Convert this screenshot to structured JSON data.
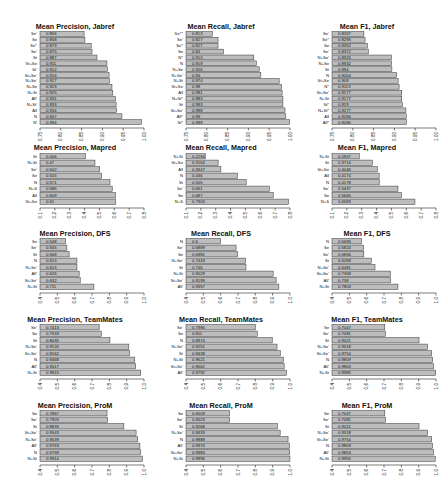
{
  "chart_data": [
    {
      "type": "bar",
      "orientation": "horizontal",
      "title": "Mean Precision, Jabref",
      "xlim": [
        0.75,
        1.0
      ],
      "ticks": [
        "0.75",
        "0.80",
        "0.85",
        "0.90",
        "0.95",
        "1.00"
      ],
      "categories": [
        "Se'",
        "Se",
        "Se*",
        "Se'",
        "St",
        "St+Se",
        "St'",
        "St+Se'",
        "N+Se'",
        "N+Se",
        "N+St",
        "All'",
        "N+St'",
        "All",
        "N",
        "N'"
      ],
      "values": [
        0.856,
        0.858,
        0.873,
        0.875,
        0.887,
        0.911,
        0.912,
        0.916,
        0.917,
        0.923,
        0.925,
        0.931,
        0.933,
        0.934,
        0.947,
        0.994
      ]
    },
    {
      "type": "bar",
      "orientation": "horizontal",
      "title": "Mean Recall, Jabref",
      "xlim": [
        0.75,
        1.0
      ],
      "ticks": [
        "0.75",
        "0.80",
        "0.85",
        "0.90",
        "0.95",
        "1.00"
      ],
      "categories": [
        "Se**",
        "Se'",
        "Se*",
        "Se",
        "N*",
        "N",
        "N+Se",
        "N+Se'",
        "N+St",
        "St+Se",
        "All",
        "N+St*",
        "St",
        "St+Se'",
        "All*",
        "St*"
      ],
      "values": [
        0.813,
        0.827,
        0.827,
        0.84,
        0.913,
        0.919,
        0.926,
        0.93,
        0.974,
        0.98,
        0.981,
        0.983,
        0.983,
        0.988,
        0.99,
        0.999
      ]
    },
    {
      "type": "bar",
      "orientation": "horizontal",
      "title": "Mean F1, Jabref",
      "xlim": [
        0.75,
        1.0
      ],
      "ticks": [
        "0.75",
        "0.80",
        "0.85",
        "0.90",
        "0.95",
        "1.00"
      ],
      "categories": [
        "Se'",
        "Se*",
        "Se",
        "Se'",
        "N+Se'",
        "N+Se",
        "St",
        "N",
        "St+Se",
        "N*",
        "St+Se'",
        "N+St",
        "St*",
        "N+St*",
        "All",
        "All*"
      ],
      "values": [
        0.8267,
        0.8295,
        0.8352,
        0.8372,
        0.8926,
        0.8932,
        0.894,
        0.9054,
        0.909,
        0.9113,
        0.9177,
        0.9177,
        0.919,
        0.9277,
        0.9284,
        0.9286
      ]
    },
    {
      "type": "bar",
      "orientation": "horizontal",
      "title": "Mean Precision, Mapred",
      "xlim": [
        0.1,
        0.8
      ],
      "ticks": [
        "0.1",
        "0.2",
        "0.3",
        "0.4",
        "0.5",
        "0.6",
        "0.7",
        "0.8"
      ],
      "categories": [
        "St",
        "N+St",
        "Se'",
        "Se",
        "N",
        "N+S",
        "All",
        "St+Se"
      ],
      "values": [
        0.406,
        0.47,
        0.502,
        0.515,
        0.571,
        0.586,
        0.609,
        0.61
      ]
    },
    {
      "type": "bar",
      "orientation": "horizontal",
      "title": "Mean Recall, Mapred",
      "xlim": [
        0.1,
        0.8
      ],
      "ticks": [
        "0.1",
        "0.2",
        "0.3",
        "0.4",
        "0.5",
        "0.6",
        "0.7",
        "0.8"
      ],
      "categories": [
        "N+St",
        "St+Se",
        "All",
        "N",
        "St",
        "Se'",
        "Se",
        "N+S"
      ],
      "values": [
        0.2294,
        0.3164,
        0.3347,
        0.446,
        0.505,
        0.661,
        0.687,
        0.7903
      ]
    },
    {
      "type": "bar",
      "orientation": "horizontal",
      "title": "Mean F1, Mapred",
      "xlim": [
        0.1,
        0.8
      ],
      "ticks": [
        "0.1",
        "0.2",
        "0.3",
        "0.4",
        "0.5",
        "0.6",
        "0.7",
        "0.8"
      ],
      "categories": [
        "N+St",
        "St",
        "St+Se",
        "All",
        "N",
        "Se'",
        "Se",
        "N+S"
      ],
      "values": [
        0.2837,
        0.3714,
        0.4046,
        0.4174,
        0.4178,
        0.5437,
        0.5665,
        0.6583
      ]
    },
    {
      "type": "bar",
      "orientation": "horizontal",
      "title": "Mean Precision, DFS",
      "xlim": [
        0.4,
        1.0
      ],
      "ticks": [
        "0.4",
        "0.5",
        "0.6",
        "0.7",
        "0.8",
        "0.9",
        "1.0"
      ],
      "categories": [
        "Se",
        "Se'",
        "St",
        "N",
        "N+Se'",
        "All'",
        "St+Se'",
        "N+St"
      ],
      "values": [
        0.548,
        0.555,
        0.568,
        0.613,
        0.613,
        0.626,
        0.632,
        0.711
      ]
    },
    {
      "type": "bar",
      "orientation": "horizontal",
      "title": "Mean Recall, DFS",
      "xlim": [
        0.4,
        1.0
      ],
      "ticks": [
        "0.4",
        "0.5",
        "0.6",
        "0.7",
        "0.8",
        "0.9",
        "1.0"
      ],
      "categories": [
        "N",
        "Se'",
        "Se",
        "N+Se'",
        "St",
        "N+St",
        "St+Se'",
        "All'"
      ],
      "values": [
        0.6,
        0.6889,
        0.6981,
        0.7443,
        0.746,
        0.9029,
        0.9199,
        0.9357
      ]
    },
    {
      "type": "bar",
      "orientation": "horizontal",
      "title": "Mean F1, DFS",
      "xlim": [
        0.4,
        1.0
      ],
      "ticks": [
        "0.4",
        "0.5",
        "0.6",
        "0.7",
        "0.8",
        "0.9",
        "1.0"
      ],
      "categories": [
        "N",
        "Se",
        "Se'",
        "St",
        "N+Se'",
        "St+Se'",
        "All'",
        "N+St"
      ],
      "values": [
        0.5696,
        0.5824,
        0.5836,
        0.6268,
        0.6481,
        0.7368,
        0.738,
        0.7803
      ]
    },
    {
      "type": "bar",
      "orientation": "horizontal",
      "title": "Mean Precision, TeamMates",
      "xlim": [
        0.4,
        1.0
      ],
      "ticks": [
        "0.4",
        "0.5",
        "0.6",
        "0.7",
        "0.8",
        "0.9",
        "1.0"
      ],
      "categories": [
        "Se'",
        "Se",
        "St",
        "N+Se'",
        "St+Se'",
        "N",
        "All'",
        "N+St"
      ],
      "values": [
        0.7413,
        0.7533,
        0.8035,
        0.9126,
        0.9162,
        0.9468,
        0.9517,
        0.9815
      ]
    },
    {
      "type": "bar",
      "orientation": "horizontal",
      "title": "Mean Recall, TeamMates",
      "xlim": [
        0.4,
        1.0
      ],
      "ticks": [
        "0.4",
        "0.5",
        "0.6",
        "0.7",
        "0.8",
        "0.9",
        "1.0"
      ],
      "categories": [
        "Se'",
        "Se",
        "N",
        "N+Se'",
        "St",
        "N+St",
        "St+Se'",
        "All'"
      ],
      "values": [
        0.7995,
        0.811,
        0.8974,
        0.9251,
        0.9438,
        0.9621,
        0.9662,
        0.9792
      ]
    },
    {
      "type": "bar",
      "orientation": "horizontal",
      "title": "Mean F1, TeamMates",
      "xlim": [
        0.4,
        1.0
      ],
      "ticks": [
        "0.4",
        "0.5",
        "0.6",
        "0.7",
        "0.8",
        "0.9",
        "1.0"
      ],
      "categories": [
        "Se",
        "Se'",
        "St",
        "N+Se'",
        "St+Se'",
        "N",
        "All'",
        "N+St"
      ],
      "values": [
        0.7047,
        0.7081,
        0.9021,
        0.9518,
        0.9754,
        0.9809,
        0.9863,
        0.9985
      ]
    },
    {
      "type": "bar",
      "orientation": "horizontal",
      "title": "Mean Precision, ProM",
      "xlim": [
        0.4,
        1.0
      ],
      "ticks": [
        "0.4",
        "0.5",
        "0.6",
        "0.7",
        "0.8",
        "0.9",
        "1.0"
      ],
      "categories": [
        "Se",
        "Se'",
        "St",
        "St+Se'",
        "N+Se'",
        "All'",
        "N",
        "N+St"
      ],
      "values": [
        0.7867,
        0.7903,
        0.8839,
        0.9543,
        0.9639,
        0.9763,
        0.9799,
        0.9914
      ]
    },
    {
      "type": "bar",
      "orientation": "horizontal",
      "title": "Mean Recall, ProM",
      "xlim": [
        0.4,
        1.0
      ],
      "ticks": [
        "0.4",
        "0.5",
        "0.6",
        "0.7",
        "0.8",
        "0.9",
        "1.0"
      ],
      "categories": [
        "Se",
        "Se'",
        "St",
        "N+Se'",
        "N",
        "All'",
        "St+Se'",
        "N+St"
      ],
      "values": [
        0.6509,
        0.6523,
        0.9268,
        0.9433,
        0.9888,
        0.9974,
        0.9983,
        0.9996
      ]
    },
    {
      "type": "bar",
      "orientation": "horizontal",
      "title": "Mean F1, ProM",
      "xlim": [
        0.4,
        1.0
      ],
      "ticks": [
        "0.4",
        "0.5",
        "0.6",
        "0.7",
        "0.8",
        "0.9",
        "1.0"
      ],
      "categories": [
        "Se",
        "Se'",
        "St",
        "N+Se'",
        "St+Se'",
        "N",
        "All'",
        "N+St"
      ],
      "values": [
        0.7047,
        0.7081,
        0.9021,
        0.9518,
        0.9754,
        0.9809,
        0.9853,
        0.9955
      ]
    }
  ]
}
